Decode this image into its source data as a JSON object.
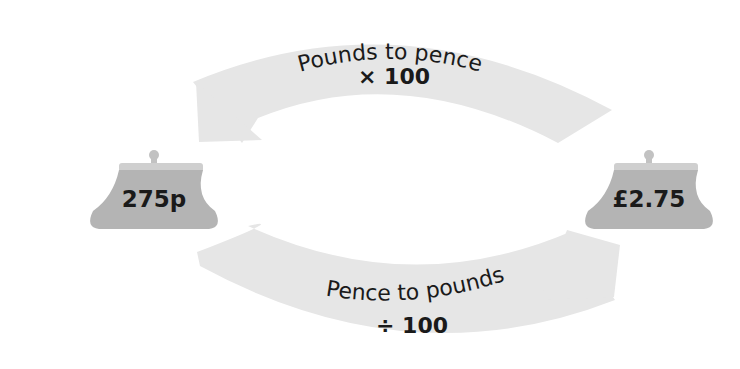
{
  "diagram": {
    "colors": {
      "arrow_fill": "#e6e6e6",
      "purse_body": "#b4b4b4",
      "purse_frame": "#cfcfcf",
      "text": "#1a1a1a"
    },
    "top_arrow": {
      "direction": "right-to-left",
      "label": "Pounds to pence",
      "operation": "× 100"
    },
    "bottom_arrow": {
      "direction": "left-to-right",
      "label": "Pence to pounds",
      "operation": "÷ 100"
    },
    "left_purse": {
      "icon": "purse-icon",
      "value": "275p"
    },
    "right_purse": {
      "icon": "purse-icon",
      "value": "£2.75"
    }
  }
}
